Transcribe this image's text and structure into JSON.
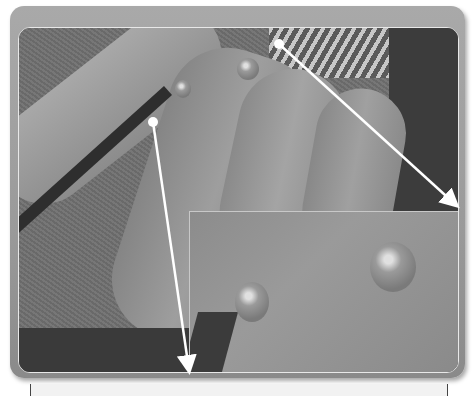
{
  "figure": {
    "colors": {
      "frame": "#9a9a9a",
      "frame_border": "#e8e8e8",
      "callout_line": "#ffffff",
      "dark_region": "#3c3c3c"
    },
    "callouts": [
      {
        "from": [
          279,
          44
        ],
        "to": [
          458,
          206
        ],
        "target": "inset-top-right"
      },
      {
        "from": [
          153,
          122
        ],
        "to": [
          189,
          372
        ],
        "target": "inset-bottom-left"
      }
    ],
    "inset": {
      "x": 188,
      "y": 210,
      "width": 271,
      "height": 163
    }
  },
  "caption": {
    "text": ""
  }
}
